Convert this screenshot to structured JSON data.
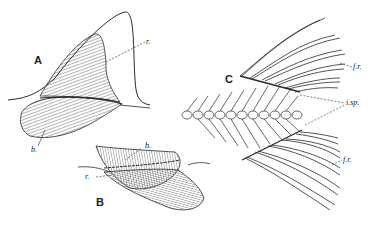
{
  "figure": {
    "panels": [
      {
        "id": "A",
        "label": "A"
      },
      {
        "id": "B",
        "label": "B"
      },
      {
        "id": "C",
        "label": "C"
      }
    ],
    "annotations": {
      "A_r": "r.",
      "A_b": "b.",
      "B_b": "b.",
      "B_r": "r.",
      "C_fr_top": "f.r.",
      "C_isp": "i.sp.",
      "C_fr_bottom": "f.r."
    },
    "colors": {
      "ink": "#2a2a2a",
      "background": "#ffffff"
    }
  }
}
